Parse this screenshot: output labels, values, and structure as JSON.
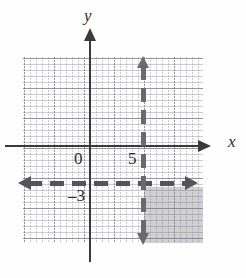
{
  "figure": {
    "kind": "coordinate-plane-inequality-graph",
    "axis_labels": {
      "x": "x",
      "y": "y"
    },
    "tick_labels": {
      "origin": "0",
      "x_five": "5",
      "y_neg_three": "–3"
    }
  },
  "chart_data": {
    "type": "line",
    "title": "",
    "xlabel": "x",
    "ylabel": "y",
    "grid": true,
    "legend": false,
    "xlim": [
      -11,
      19
    ],
    "ylim": [
      -16,
      15
    ],
    "xticks": [
      0,
      5
    ],
    "yticks": [
      -3
    ],
    "xtick_labels": [
      "0",
      "5"
    ],
    "ytick_labels": [
      "–3"
    ],
    "series": [
      {
        "name": "x = 5",
        "kind": "vertical-boundary-line",
        "style": "dashed",
        "x": 5,
        "arrows": [
          "up",
          "down"
        ],
        "color": "#6a6a6e"
      },
      {
        "name": "y = –3",
        "kind": "horizontal-boundary-line",
        "style": "dashed",
        "y": -3,
        "arrows": [
          "left",
          "right"
        ],
        "color": "#555559"
      }
    ],
    "shaded_regions": [
      {
        "name": "solution-region",
        "description": "x > 5 and y < –3",
        "x_range": [
          5,
          15
        ],
        "y_range": [
          -12,
          -3
        ],
        "color": "#787880",
        "opacity": 0.34
      }
    ],
    "annotations": []
  }
}
